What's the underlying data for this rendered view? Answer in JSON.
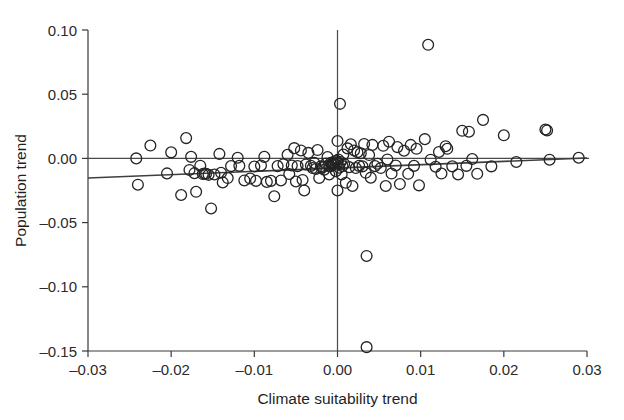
{
  "figure": {
    "background_color": "#ffffff",
    "point_color": "#242424",
    "line_color": "#3f3f3f"
  },
  "axes": {
    "x_title": "Climate suitability trend",
    "y_title": "Population trend",
    "x_ticks": [
      "-0.03",
      "-0.02",
      "-0.01",
      "0.00",
      "0.01",
      "0.02",
      "0.03"
    ],
    "y_ticks": [
      "0.10",
      "0.05",
      "0.00",
      "-0.05",
      "-0.10",
      "-0.15"
    ]
  },
  "chart_data": {
    "type": "scatter",
    "title": "",
    "xlabel": "Climate suitability trend",
    "ylabel": "Population trend",
    "xlim": [
      -0.03,
      0.03
    ],
    "ylim": [
      -0.15,
      0.1
    ],
    "xticks": [
      -0.03,
      -0.02,
      -0.01,
      0.0,
      0.01,
      0.02,
      0.03
    ],
    "yticks": [
      0.1,
      0.05,
      0.0,
      -0.05,
      -0.1,
      -0.15
    ],
    "grid": false,
    "legend": "none",
    "annotations": [
      {
        "kind": "reference-line",
        "orientation": "horizontal",
        "value": 0.0
      },
      {
        "kind": "reference-line",
        "orientation": "vertical",
        "value": 0.0
      },
      {
        "kind": "regression-line",
        "x": [
          -0.03,
          0.03
        ],
        "y": [
          -0.0153,
          0.0003
        ]
      }
    ],
    "marker": {
      "shape": "circle",
      "filled": false,
      "size": 5.4
    },
    "n_points": 134,
    "points": [
      [
        -0.0242,
        0.0
      ],
      [
        -0.024,
        -0.0205
      ],
      [
        -0.0225,
        0.01
      ],
      [
        -0.0205,
        -0.0117
      ],
      [
        -0.02,
        0.0047
      ],
      [
        -0.0188,
        -0.0285
      ],
      [
        -0.0182,
        0.0158
      ],
      [
        -0.0178,
        -0.009
      ],
      [
        -0.0176,
        0.0012
      ],
      [
        -0.0172,
        -0.0115
      ],
      [
        -0.017,
        -0.026
      ],
      [
        -0.0165,
        -0.0057
      ],
      [
        -0.0162,
        -0.0122
      ],
      [
        -0.016,
        -0.0118
      ],
      [
        -0.0158,
        -0.012
      ],
      [
        -0.0155,
        -0.0128
      ],
      [
        -0.0152,
        -0.039
      ],
      [
        -0.0148,
        -0.0125
      ],
      [
        -0.0142,
        0.0035
      ],
      [
        -0.014,
        -0.0112
      ],
      [
        -0.0138,
        -0.0187
      ],
      [
        -0.0132,
        -0.0153
      ],
      [
        -0.0128,
        -0.006
      ],
      [
        -0.012,
        0.0005
      ],
      [
        -0.0118,
        -0.0058
      ],
      [
        -0.0112,
        -0.0172
      ],
      [
        -0.0105,
        -0.0157
      ],
      [
        -0.01,
        -0.0063
      ],
      [
        -0.0098,
        -0.0175
      ],
      [
        -0.0092,
        -0.0055
      ],
      [
        -0.0088,
        0.0012
      ],
      [
        -0.0085,
        -0.0183
      ],
      [
        -0.008,
        -0.0175
      ],
      [
        -0.0076,
        -0.0295
      ],
      [
        -0.0072,
        -0.006
      ],
      [
        -0.0068,
        -0.0172
      ],
      [
        -0.0065,
        -0.0045
      ],
      [
        -0.006,
        0.0028
      ],
      [
        -0.0058,
        -0.0122
      ],
      [
        -0.0055,
        -0.0055
      ],
      [
        -0.0052,
        0.008
      ],
      [
        -0.005,
        -0.018
      ],
      [
        -0.0048,
        -0.006
      ],
      [
        -0.0044,
        0.0062
      ],
      [
        -0.0042,
        -0.0168
      ],
      [
        -0.004,
        -0.025
      ],
      [
        -0.0038,
        -0.0047
      ],
      [
        -0.0035,
        0.0043
      ],
      [
        -0.0032,
        -0.0058
      ],
      [
        -0.003,
        -0.0075
      ],
      [
        -0.0028,
        -0.0035
      ],
      [
        -0.0026,
        -0.0082
      ],
      [
        -0.0024,
        0.0065
      ],
      [
        -0.0022,
        -0.0152
      ],
      [
        -0.002,
        -0.0062
      ],
      [
        -0.0018,
        -0.007
      ],
      [
        -0.0016,
        -0.0088
      ],
      [
        -0.0014,
        -0.004
      ],
      [
        -0.0012,
        0.001
      ],
      [
        -0.0011,
        -0.0055
      ],
      [
        -0.001,
        -0.0125
      ],
      [
        -0.0009,
        -0.0062
      ],
      [
        -0.0008,
        -0.0035
      ],
      [
        -0.0007,
        -0.0045
      ],
      [
        -0.0006,
        -0.0052
      ],
      [
        -0.0005,
        -0.003
      ],
      [
        -0.0004,
        -0.0042
      ],
      [
        -0.0003,
        -0.0022
      ],
      [
        -0.0002,
        -0.005
      ],
      [
        -0.0002,
        -0.01
      ],
      [
        -0.0001,
        -0.0018
      ],
      [
        0.0,
        -0.0035
      ],
      [
        0.0,
        0.0135
      ],
      [
        0.0,
        -0.025
      ],
      [
        0.0001,
        -0.0008
      ],
      [
        0.0002,
        -0.0072
      ],
      [
        0.0003,
        0.0425
      ],
      [
        0.0004,
        -0.0028
      ],
      [
        0.0005,
        -0.0125
      ],
      [
        0.0006,
        -0.006
      ],
      [
        0.0007,
        0.003
      ],
      [
        0.0008,
        -0.0042
      ],
      [
        0.001,
        -0.019
      ],
      [
        0.0012,
        0.0078
      ],
      [
        0.0014,
        -0.0068
      ],
      [
        0.0016,
        0.011
      ],
      [
        0.0018,
        -0.0215
      ],
      [
        0.002,
        0.0062
      ],
      [
        0.0022,
        -0.0075
      ],
      [
        0.0024,
        0.0048
      ],
      [
        0.0026,
        -0.0058
      ],
      [
        0.0028,
        0.004
      ],
      [
        0.003,
        -0.0062
      ],
      [
        0.0032,
        0.0112
      ],
      [
        0.0034,
        -0.0112
      ],
      [
        0.0035,
        -0.076
      ],
      [
        0.0035,
        -0.147
      ],
      [
        0.0038,
        0.0026
      ],
      [
        0.004,
        -0.015
      ],
      [
        0.0042,
        0.0105
      ],
      [
        0.0045,
        -0.006
      ],
      [
        0.0048,
        -0.0042
      ],
      [
        0.0052,
        -0.0075
      ],
      [
        0.0055,
        0.0098
      ],
      [
        0.0058,
        -0.0215
      ],
      [
        0.006,
        -0.0008
      ],
      [
        0.0062,
        0.013
      ],
      [
        0.0065,
        -0.0118
      ],
      [
        0.007,
        -0.0055
      ],
      [
        0.0072,
        0.0088
      ],
      [
        0.0075,
        -0.02
      ],
      [
        0.008,
        0.006
      ],
      [
        0.0085,
        -0.012
      ],
      [
        0.0088,
        0.0105
      ],
      [
        0.0092,
        -0.0058
      ],
      [
        0.0095,
        0.0075
      ],
      [
        0.0098,
        -0.021
      ],
      [
        0.0105,
        0.015
      ],
      [
        0.0109,
        0.0885
      ],
      [
        0.0112,
        -0.001
      ],
      [
        0.0118,
        -0.0065
      ],
      [
        0.0122,
        0.005
      ],
      [
        0.0125,
        -0.0118
      ],
      [
        0.013,
        0.0095
      ],
      [
        0.0132,
        0.0075
      ],
      [
        0.0138,
        -0.0062
      ],
      [
        0.0145,
        -0.0125
      ],
      [
        0.015,
        0.0215
      ],
      [
        0.0155,
        -0.0058
      ],
      [
        0.0158,
        0.0208
      ],
      [
        0.0162,
        -0.0005
      ],
      [
        0.0168,
        -0.012
      ],
      [
        0.0175,
        0.03
      ],
      [
        0.0185,
        -0.0062
      ],
      [
        0.02,
        0.018
      ],
      [
        0.0215,
        -0.0028
      ],
      [
        0.025,
        0.0225
      ],
      [
        0.0252,
        0.0218
      ],
      [
        0.0255,
        -0.001
      ],
      [
        0.029,
        0.0005
      ]
    ]
  }
}
